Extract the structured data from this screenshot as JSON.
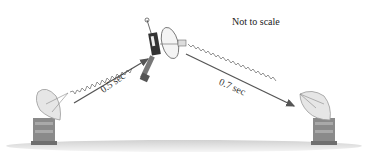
{
  "diagram": {
    "note": "Not to scale",
    "signal_left": {
      "label": "0.5 sec"
    },
    "signal_right": {
      "label": "0.7 sec"
    },
    "elements": {
      "left_station": "radio-dish-antenna",
      "spacecraft": "space-probe",
      "right_station": "radio-dish-antenna"
    },
    "colors": {
      "arrow": "#555555",
      "wave": "#777777",
      "ground": "#d8d8d8",
      "text": "#333333"
    }
  }
}
